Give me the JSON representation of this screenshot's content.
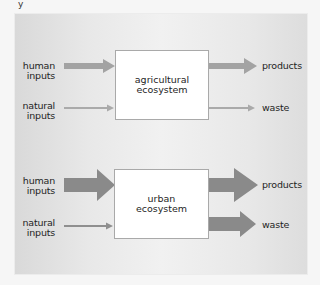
{
  "top_fragment": "y",
  "diagrams": [
    {
      "id": "agricultural",
      "system_label_line1": "agricultural",
      "system_label_line2": "ecosystem",
      "inputs": [
        {
          "line1": "human",
          "line2": "inputs",
          "relative_magnitude": "medium"
        },
        {
          "line1": "natural",
          "line2": "inputs",
          "relative_magnitude": "small"
        }
      ],
      "outputs": [
        {
          "label": "products",
          "relative_magnitude": "medium"
        },
        {
          "label": "waste",
          "relative_magnitude": "small"
        }
      ]
    },
    {
      "id": "urban",
      "system_label_line1": "urban",
      "system_label_line2": "ecosystem",
      "inputs": [
        {
          "line1": "human",
          "line2": "inputs",
          "relative_magnitude": "large"
        },
        {
          "line1": "natural",
          "line2": "inputs",
          "relative_magnitude": "small"
        }
      ],
      "outputs": [
        {
          "label": "products",
          "relative_magnitude": "large"
        },
        {
          "label": "waste",
          "relative_magnitude": "large"
        }
      ]
    }
  ],
  "colors": {
    "arrow_light": "#a3a3a3",
    "arrow_dark": "#8c8c8c",
    "box_border": "#a9a9a9",
    "box_fill": "#ffffff",
    "text": "#1e1e1e"
  }
}
